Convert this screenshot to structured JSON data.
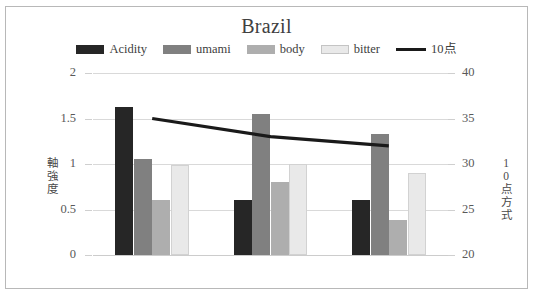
{
  "chart_data": {
    "type": "bar",
    "title": "Brazil",
    "categories": [
      "SW",
      "PN",
      "N"
    ],
    "series": [
      {
        "name": "Acidity",
        "values": [
          1.63,
          0.61,
          0.61
        ],
        "axis": "left",
        "color": "#262626"
      },
      {
        "name": "umami",
        "values": [
          1.05,
          1.55,
          1.33
        ],
        "axis": "left",
        "color": "#808080"
      },
      {
        "name": "body",
        "values": [
          0.61,
          0.8,
          0.38
        ],
        "axis": "left",
        "color": "#aeaeae"
      },
      {
        "name": "bitter",
        "values": [
          0.99,
          1.0,
          0.9
        ],
        "axis": "left",
        "color": "#e9e9e9"
      },
      {
        "name": "10点",
        "values": [
          35.0,
          33.0,
          32.0
        ],
        "axis": "right",
        "color": "#1a1a1a",
        "type": "line"
      }
    ],
    "xlabel": "",
    "ylabel": "軸強度",
    "ylabel_secondary": "10点方式",
    "ylim": [
      0,
      2
    ],
    "yticks": [
      "0",
      "0.5",
      "1",
      "1.5",
      "2"
    ],
    "ylim_secondary": [
      20,
      40
    ],
    "yticks_secondary": [
      "20",
      "25",
      "30",
      "35",
      "40"
    ],
    "grid": true,
    "legend_position": "top"
  },
  "legend": {
    "items": [
      {
        "label": "Acidity",
        "swatch": "legend-swatch-acidity",
        "color": "#262626",
        "kind": "bar"
      },
      {
        "label": "umami",
        "swatch": "legend-swatch-umami",
        "color": "#808080",
        "kind": "bar"
      },
      {
        "label": "body",
        "swatch": "legend-swatch-body",
        "color": "#aeaeae",
        "kind": "bar"
      },
      {
        "label": "bitter",
        "swatch": "legend-swatch-bitter",
        "color": "#e9e9e9",
        "kind": "bar"
      },
      {
        "label": "10点",
        "swatch": "legend-swatch-10ten",
        "color": "#1a1a1a",
        "kind": "line"
      }
    ]
  }
}
